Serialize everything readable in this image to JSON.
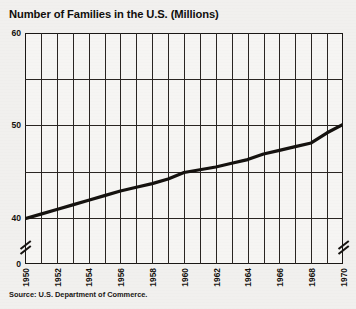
{
  "chart_data": {
    "type": "line",
    "title": "Number of Families in the U.S. (Millions)",
    "xlabel": "",
    "ylabel": "",
    "source": "Source: U.S. Department of Commerce.",
    "grid": true,
    "legend": "none",
    "xlim": [
      1950,
      1970
    ],
    "ylim": [
      35,
      60
    ],
    "y_axis_break": true,
    "y_break_label": "0",
    "y_tick_labels": [
      "60",
      "50",
      "40",
      "0"
    ],
    "y_gridlines": [
      60,
      55,
      50,
      45,
      40,
      35
    ],
    "x_tick_labels": [
      "1950",
      "1952",
      "1954",
      "1956",
      "1958",
      "1960",
      "1962",
      "1964",
      "1966",
      "1968",
      "1970"
    ],
    "x": [
      1950,
      1951,
      1952,
      1953,
      1954,
      1955,
      1956,
      1957,
      1958,
      1959,
      1960,
      1961,
      1962,
      1963,
      1964,
      1965,
      1966,
      1967,
      1968,
      1969,
      1970
    ],
    "values": [
      39.9,
      40.4,
      40.9,
      41.4,
      41.9,
      42.4,
      42.9,
      43.3,
      43.7,
      44.2,
      44.9,
      45.2,
      45.5,
      45.9,
      46.3,
      46.9,
      47.3,
      47.7,
      48.1,
      49.2,
      50.1
    ],
    "series": [
      {
        "name": "Number of families",
        "values": [
          39.9,
          40.4,
          40.9,
          41.4,
          41.9,
          42.4,
          42.9,
          43.3,
          43.7,
          44.2,
          44.9,
          45.2,
          45.5,
          45.9,
          46.3,
          46.9,
          47.3,
          47.7,
          48.1,
          49.2,
          50.1
        ],
        "color": "#15120f"
      }
    ]
  }
}
